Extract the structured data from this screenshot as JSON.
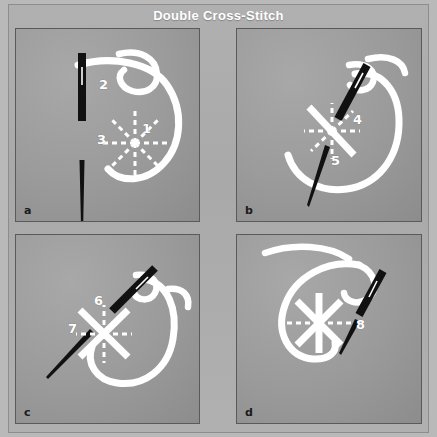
{
  "figure": {
    "title": "Double Cross-Stitch",
    "background_color": "#b9b9b9",
    "plate_color": "#acacac",
    "panel_border_color": "#5a5a5a",
    "thread_color": "#ffffff",
    "needle_color": "#111111",
    "number_color": "#ffffff"
  },
  "panels": [
    {
      "id": "a",
      "letter": "a",
      "caption_letter": "a",
      "numbers": [
        "2",
        "3",
        "1"
      ],
      "description": "Needle entering fabric with eight dashed guide spokes; thread loop to the right.",
      "guide_style": "dashed-asterisk-8",
      "needle": "vertical",
      "labels": [
        {
          "text": "2",
          "x": 104,
          "y": 83
        },
        {
          "text": "3",
          "x": 102,
          "y": 137
        },
        {
          "text": "1",
          "x": 139,
          "y": 124
        }
      ]
    },
    {
      "id": "b",
      "letter": "b",
      "caption_letter": "b",
      "numbers": [
        "4",
        "5"
      ],
      "description": "First diagonal stitch completed; needle angled down-left, remaining spokes dashed.",
      "guide_style": "one-solid-diagonal",
      "needle": "diagonal",
      "labels": [
        {
          "text": "4",
          "x": 352,
          "y": 115
        },
        {
          "text": "5",
          "x": 330,
          "y": 156
        }
      ]
    },
    {
      "id": "c",
      "letter": "c",
      "caption_letter": "c",
      "numbers": [
        "6",
        "7"
      ],
      "description": "Both diagonals worked forming an X; vertical and horizontal spokes still dashed.",
      "guide_style": "x-solid",
      "needle": "diagonal",
      "labels": [
        {
          "text": "6",
          "x": 88,
          "y": 307
        },
        {
          "text": "7",
          "x": 65,
          "y": 330
        }
      ]
    },
    {
      "id": "d",
      "letter": "d",
      "caption_letter": "d",
      "numbers": [
        "8"
      ],
      "description": "Vertical stitch added to the X; last horizontal shown dashed, needle exits upper right.",
      "guide_style": "star-six-solid",
      "needle": "diagonal",
      "labels": [
        {
          "text": "8",
          "x": 354,
          "y": 320
        }
      ]
    }
  ]
}
